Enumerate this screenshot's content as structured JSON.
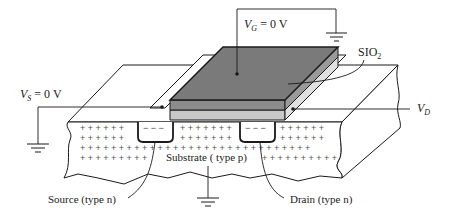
{
  "labels": {
    "vg": {
      "sym": "V",
      "sub": "G",
      "rest": " = 0 V"
    },
    "vs": {
      "sym": "V",
      "sub": "S",
      "rest": " = 0 V"
    },
    "vd": {
      "sym": "V",
      "sub": "D"
    },
    "sio2": {
      "main": "SIO",
      "sub": "2"
    },
    "substrate": "Substrate ( type p)",
    "source": "Source (type n)",
    "drain": "Drain (type n)"
  },
  "symbols": {
    "substrate_charge": "+",
    "channel_charge": "− − −"
  },
  "colors": {
    "gate_metal": "#7a7a7a",
    "gate_side": "#8c8c8c",
    "oxide": "#c8c8c8",
    "line": "#1a1a1a",
    "background": "#ffffff"
  }
}
